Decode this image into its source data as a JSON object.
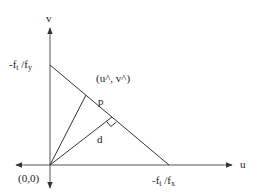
{
  "diagram": {
    "type": "geometry",
    "colors": {
      "stroke": "#333333",
      "text": "#222222",
      "background": "#ffffff"
    },
    "axes": {
      "horizontal_label": "u",
      "vertical_label": "v",
      "origin_label": "(0,0)"
    },
    "intercepts": {
      "v_intercept": {
        "prefix": "-f",
        "sub1": "t",
        "mid": " /f",
        "sub2": "y"
      },
      "u_intercept": {
        "prefix": "-f",
        "sub1": "t",
        "mid": " /f",
        "sub2": "x"
      }
    },
    "points": {
      "hat_point_label": "(u^, v^)",
      "p_label": "p",
      "d_label": "d"
    },
    "annotations": {
      "right_angle_marker": "perpendicular foot of d on the line"
    }
  }
}
